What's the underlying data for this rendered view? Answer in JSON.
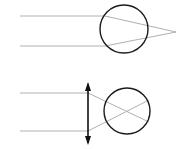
{
  "figure": {
    "background_color": "#ffffff",
    "width": 188,
    "height": 149,
    "ray_color": "#b0b0b0",
    "circle_color": "#1a1a1a",
    "arrow_color": "#111111",
    "ray_stroke_width": 1,
    "circle_stroke_width": 1.4,
    "arrow_stroke_width": 1.6
  },
  "chart_data": {
    "type": "diagram",
    "panels": [
      {
        "name": "top-panel",
        "label": "Parallel rays converging to a focal point",
        "circle": {
          "cx": 124,
          "cy": 29,
          "r": 24
        },
        "incoming_rays": [
          {
            "name": "upper-incoming-ray",
            "x1": 20,
            "y1": 16,
            "x2": 105,
            "y2": 16
          },
          {
            "name": "lower-incoming-ray",
            "x1": 20,
            "y1": 46,
            "x2": 105,
            "y2": 46
          }
        ],
        "refracted_rays": [
          {
            "name": "upper-refracted-ray",
            "x1": 105,
            "y1": 16,
            "x2": 176,
            "y2": 32
          },
          {
            "name": "lower-refracted-ray",
            "x1": 105,
            "y1": 46,
            "x2": 176,
            "y2": 32
          }
        ],
        "focal_point": {
          "name": "focal-point",
          "x": 176,
          "y": 32
        }
      },
      {
        "name": "bottom-panel",
        "label": "Rays through aperture crossing inside sphere",
        "circle": {
          "cx": 127,
          "cy": 111,
          "r": 23
        },
        "aperture_arrow": {
          "name": "aperture-arrow",
          "x": 88,
          "y_top": 82,
          "y_bottom": 145,
          "double_headed": true
        },
        "incoming_rays": [
          {
            "name": "upper-incoming-ray",
            "x1": 20,
            "y1": 93,
            "x2": 88,
            "y2": 93
          },
          {
            "name": "lower-incoming-ray",
            "x1": 20,
            "y1": 131,
            "x2": 88,
            "y2": 131
          }
        ],
        "crossing_rays": [
          {
            "name": "upper-crossing-ray",
            "x1": 88,
            "y1": 93,
            "x2": 149,
            "y2": 122
          },
          {
            "name": "lower-crossing-ray",
            "x1": 88,
            "y1": 131,
            "x2": 149,
            "y2": 100
          }
        ]
      }
    ]
  }
}
